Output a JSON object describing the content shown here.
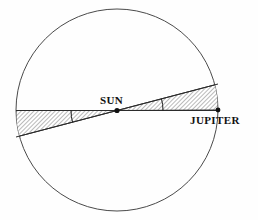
{
  "figure": {
    "background_color": "#fefefe",
    "width": 258,
    "height": 220
  },
  "labels": {
    "sun": "SUN",
    "jupiter": "JUPITER"
  },
  "colors": {
    "outline": "#4a4a4a",
    "line": "#2b2b2b",
    "hatch": "#3a3a3a",
    "hatch_background": "#ffffff",
    "text": "#111111"
  },
  "geometry": {
    "circle": {
      "cx": 117,
      "cy": 110,
      "r": 101
    },
    "sun_point": {
      "x": 117,
      "y": 110.5
    },
    "jupiter_point": {
      "x": 218,
      "y": 110
    },
    "horizontal_axis": {
      "x1": 16,
      "y1": 110.5,
      "x2": 218,
      "y2": 110.5
    },
    "tilted_axis": {
      "x1": 16,
      "y1": 137,
      "x2": 218,
      "y2": 84
    },
    "wedge_right": {
      "apex_x": 117,
      "apex_y": 110.5,
      "tip_top_x": 218,
      "tip_top_y": 84,
      "tip_bottom_x": 218,
      "tip_bottom_y": 110
    },
    "wedge_left": {
      "apex_x": 117,
      "apex_y": 110.5,
      "tip_top_x": 16,
      "tip_top_y": 110.5,
      "tip_bottom_x": 16,
      "tip_bottom_y": 137
    },
    "angle_arc_right": {
      "cx": 117,
      "cy": 110.5,
      "r": 46
    },
    "angle_arc_left": {
      "cx": 117,
      "cy": 110.5,
      "r": 46
    }
  },
  "label_positions": {
    "sun": {
      "x": 100,
      "y": 104
    },
    "jupiter": {
      "x": 190,
      "y": 124
    }
  },
  "hatching": {
    "pattern": "diagonal-lines",
    "angle_deg": 45,
    "spacing_px": 3,
    "stroke_width": 0.7
  }
}
